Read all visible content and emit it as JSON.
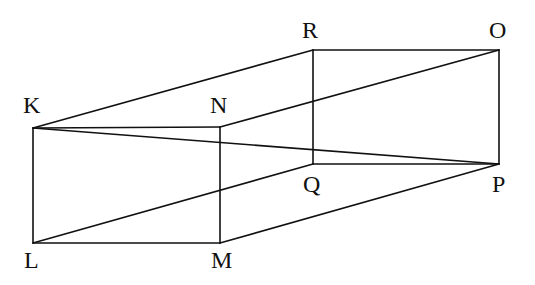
{
  "diagram": {
    "type": "rectangular prism (cuboid) wireframe",
    "vertices": {
      "K": {
        "label": "K",
        "x": 33,
        "y": 128,
        "lx": 23,
        "ly": 113
      },
      "N": {
        "label": "N",
        "x": 220,
        "y": 127,
        "lx": 210,
        "ly": 113
      },
      "M": {
        "label": "M",
        "x": 220,
        "y": 243,
        "lx": 211,
        "ly": 268
      },
      "L": {
        "label": "L",
        "x": 33,
        "y": 243,
        "lx": 24,
        "ly": 268
      },
      "R": {
        "label": "R",
        "x": 313,
        "y": 50,
        "lx": 302,
        "ly": 38
      },
      "O": {
        "label": "O",
        "x": 499,
        "y": 50,
        "lx": 489,
        "ly": 38
      },
      "P": {
        "label": "P",
        "x": 499,
        "y": 164,
        "lx": 492,
        "ly": 192
      },
      "Q": {
        "label": "Q",
        "x": 313,
        "y": 164,
        "lx": 303,
        "ly": 192
      }
    },
    "edges": [
      [
        "K",
        "N"
      ],
      [
        "N",
        "M"
      ],
      [
        "M",
        "L"
      ],
      [
        "L",
        "K"
      ],
      [
        "R",
        "O"
      ],
      [
        "O",
        "P"
      ],
      [
        "P",
        "Q"
      ],
      [
        "Q",
        "R"
      ],
      [
        "K",
        "R"
      ],
      [
        "N",
        "O"
      ],
      [
        "M",
        "P"
      ],
      [
        "L",
        "Q"
      ]
    ],
    "diagonals": [
      [
        "K",
        "P"
      ]
    ],
    "colors": {
      "line": "#111111",
      "background": "#ffffff"
    }
  }
}
